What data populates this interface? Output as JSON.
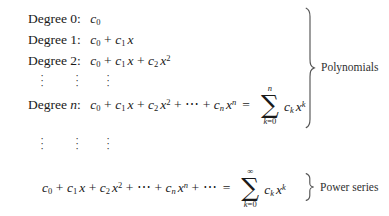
{
  "figure": {
    "kind": "math-display",
    "background": "#ffffff",
    "ink": "#1a1a1a",
    "lines": [
      {
        "id": "degree-0",
        "label": "Degree 0:",
        "expression": "c0"
      },
      {
        "id": "degree-1",
        "label": "Degree 1:",
        "expression": "c0 + c1 x"
      },
      {
        "id": "degree-2",
        "label": "Degree 2:",
        "expression": "c0 + c1 x + c2 x^2"
      },
      {
        "id": "vdots-upper",
        "label": "",
        "expression": "vertical ellipsis x3"
      },
      {
        "id": "degree-n",
        "label": "Degree n:",
        "expression": "c0 + c1 x + c2 x^2 + ... + cn x^n = sum_{k=0}^{n} ck x^k"
      },
      {
        "id": "vdots-lower",
        "label": "",
        "expression": "vertical ellipsis x3"
      },
      {
        "id": "power-series",
        "label": "",
        "expression": "c0 + c1 x + c2 x^2 + ... + cn x^n + ... = sum_{k=0}^{infinity} ck x^k"
      }
    ],
    "terms": {
      "degree_word": "Degree",
      "deg0": "0",
      "deg1": "1",
      "deg2": "2",
      "degn": "n",
      "colon": ":",
      "c": "c",
      "x": "x",
      "k": "k",
      "n": "n",
      "zero": "0",
      "one": "1",
      "two": "2",
      "plus": "+",
      "equals": "=",
      "cdots": "⋯",
      "sigma": "∑",
      "infinity": "∞",
      "k_eq_0": "k=0",
      "vdot": "·"
    },
    "braces": [
      {
        "id": "polynomials-brace",
        "label": "Polynomials",
        "orientation": "right-facing"
      },
      {
        "id": "power-series-brace",
        "label": "Power series",
        "orientation": "right-facing"
      }
    ]
  }
}
